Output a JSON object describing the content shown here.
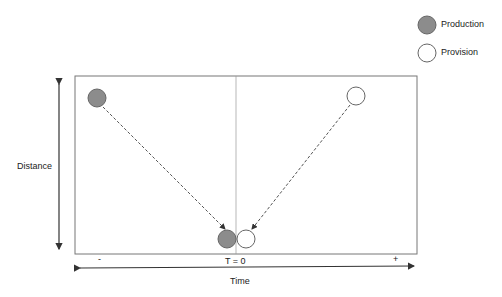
{
  "legend": {
    "items": [
      {
        "label": "Production",
        "fill": "#8c8c8c"
      },
      {
        "label": "Provision",
        "fill": "#ffffff"
      }
    ]
  },
  "axes": {
    "y_label": "Distance",
    "x_label": "Time",
    "x_minus": "-",
    "x_plus": "+",
    "center_label": "T = 0"
  },
  "colors": {
    "production_fill": "#8c8c8c",
    "provision_fill": "#ffffff",
    "stroke": "#555555"
  }
}
